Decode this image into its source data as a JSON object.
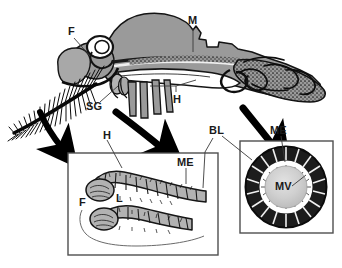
{
  "figure": {
    "colors": {
      "body_gray": "#9a9a9a",
      "light_gray": "#c9c9c9",
      "lumen_gray": "#bdbdbd",
      "outline": "#111111",
      "box_border": "#555555",
      "leader": "#4a4a4a",
      "background": "#ffffff"
    }
  },
  "main_drawing": {
    "name": "mosquito-lateral-anatomy",
    "labels": [
      {
        "key": "F",
        "text": "F",
        "x": 70,
        "y": 32,
        "meaning": "fat body"
      },
      {
        "key": "M",
        "text": "M",
        "x": 190,
        "y": 20,
        "meaning": "midgut"
      },
      {
        "key": "SG",
        "text": "SG",
        "x": 88,
        "y": 106,
        "meaning": "salivary gland"
      },
      {
        "key": "H",
        "text": "H",
        "x": 176,
        "y": 96,
        "meaning": "hindgut"
      }
    ]
  },
  "inset_left": {
    "name": "malpighian-tubules-inset",
    "box": {
      "x": 68,
      "y": 153,
      "width": 150,
      "height": 102
    },
    "labels": [
      {
        "key": "H",
        "text": "H",
        "x": 105,
        "y": 133,
        "meaning": "hindgut"
      },
      {
        "key": "ME",
        "text": "ME",
        "x": 180,
        "y": 160,
        "meaning": "Malpighian epithelium"
      },
      {
        "key": "F",
        "text": "F",
        "x": 81,
        "y": 200,
        "meaning": "fat body"
      },
      {
        "key": "L",
        "text": "L",
        "x": 118,
        "y": 196,
        "meaning": "lumen"
      }
    ]
  },
  "inset_right": {
    "name": "tubule-cross-section-inset",
    "box": {
      "x": 240,
      "y": 141,
      "width": 93,
      "height": 92
    },
    "labels": [
      {
        "key": "BL",
        "text": "BL",
        "x": 212,
        "y": 128,
        "meaning": "basal lamina"
      },
      {
        "key": "ME",
        "text": "ME",
        "x": 272,
        "y": 128,
        "meaning": "Malpighian epithelium"
      },
      {
        "key": "MV",
        "text": "MV",
        "x": 277,
        "y": 185,
        "meaning": "microvilli / lumen"
      }
    ]
  },
  "arrows": [
    {
      "name": "arrow-to-left-inset",
      "from": [
        116,
        112
      ],
      "to": [
        167,
        152
      ]
    },
    {
      "name": "arrow-to-left-inset-2",
      "from": [
        40,
        118
      ],
      "to": [
        62,
        150
      ]
    },
    {
      "name": "arrow-to-right-inset",
      "from": [
        243,
        110
      ],
      "to": [
        277,
        150
      ]
    }
  ]
}
